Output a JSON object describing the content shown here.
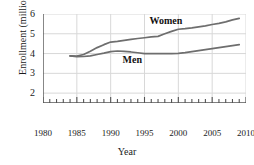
{
  "chart_data": {
    "type": "line",
    "title": "",
    "xlabel": "Year",
    "ylabel": "Enrollment (millions)",
    "xlim": [
      1980,
      2010
    ],
    "ylim": [
      1.5,
      6
    ],
    "xticks": [
      1980,
      1985,
      1990,
      1995,
      2000,
      2005,
      2010
    ],
    "yticks": [
      2,
      3,
      4,
      5,
      6
    ],
    "minor_xtick_step": 1,
    "grid": true,
    "legend_position": "inline-annotations",
    "line_color": "#6e6e6e",
    "grid_color": "#d8d8d8",
    "axis_color": "#555555",
    "series": [
      {
        "name": "Women",
        "label": "Women",
        "x": [
          1984,
          1985,
          1986,
          1987,
          1988,
          1989,
          1990,
          1991,
          1992,
          1993,
          1994,
          1995,
          1996,
          1997,
          1998,
          1999,
          2000,
          2001,
          2002,
          2003,
          2004,
          2005,
          2006,
          2007,
          2008,
          2009
        ],
        "values": [
          3.88,
          3.87,
          3.95,
          4.12,
          4.3,
          4.45,
          4.58,
          4.62,
          4.67,
          4.72,
          4.76,
          4.8,
          4.84,
          4.87,
          5.0,
          5.12,
          5.23,
          5.26,
          5.3,
          5.35,
          5.4,
          5.47,
          5.53,
          5.6,
          5.7,
          5.78
        ]
      },
      {
        "name": "Men",
        "label": "Men",
        "x": [
          1984,
          1985,
          1986,
          1987,
          1988,
          1989,
          1990,
          1991,
          1992,
          1993,
          1994,
          1995,
          1996,
          1997,
          1998,
          1999,
          2000,
          2001,
          2002,
          2003,
          2004,
          2005,
          2006,
          2007,
          2008,
          2009
        ],
        "values": [
          3.88,
          3.84,
          3.85,
          3.88,
          3.95,
          4.02,
          4.1,
          4.13,
          4.11,
          4.08,
          4.04,
          4.0,
          4.0,
          4.0,
          4.0,
          4.0,
          4.01,
          4.05,
          4.1,
          4.15,
          4.2,
          4.25,
          4.3,
          4.35,
          4.4,
          4.45
        ]
      }
    ],
    "annotations": [
      {
        "text": "Women",
        "x": 1999,
        "y": 5.6
      },
      {
        "text": "Men",
        "x": 1995,
        "y": 3.6
      }
    ]
  }
}
